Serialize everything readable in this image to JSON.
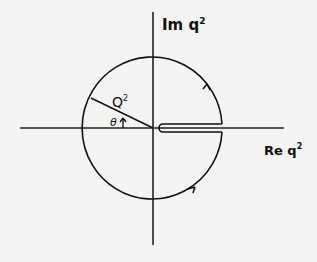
{
  "diagram": {
    "type": "contour-integral-keyhole",
    "axes": {
      "vertical_label": "Im q",
      "vertical_label_sup": "2",
      "horizontal_label": "Re q",
      "horizontal_label_sup": "2"
    },
    "circle": {
      "radius_label": "Q",
      "radius_label_sup": "2",
      "angle_label": "θ"
    },
    "colors": {
      "ink": "#111111",
      "paper": "#f4f4f2"
    }
  }
}
